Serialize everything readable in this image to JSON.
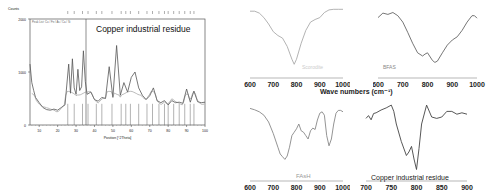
{
  "chart_data": [
    {
      "type": "line",
      "title": "Copper industrial residue",
      "xlabel": "Position [°2Theta]",
      "ylabel": "Counts",
      "xlim": [
        5,
        100
      ],
      "ylim": [
        0,
        2000
      ],
      "xticks": [
        10,
        20,
        30,
        40,
        50,
        60,
        70,
        80,
        90,
        100
      ],
      "yticks": [
        0,
        1000,
        2000
      ],
      "ytick_labels": [
        "0",
        "1000",
        "2000"
      ],
      "grid": false,
      "annotation": "XRD pattern with reference peak markers",
      "x": [
        5,
        6,
        7,
        8,
        10,
        12,
        14,
        16,
        18,
        20,
        22,
        24,
        26,
        27,
        28,
        29,
        30,
        31,
        32,
        33,
        34,
        35,
        36,
        38,
        40,
        42,
        44,
        46,
        48,
        50,
        52,
        54,
        56,
        58,
        60,
        62,
        64,
        66,
        68,
        70,
        72,
        74,
        76,
        78,
        80,
        82,
        84,
        86,
        88,
        90,
        92,
        94,
        96,
        98,
        100
      ],
      "values": [
        1150,
        800,
        650,
        520,
        420,
        330,
        290,
        280,
        300,
        280,
        330,
        380,
        1150,
        600,
        1250,
        700,
        580,
        1050,
        650,
        720,
        1400,
        820,
        580,
        620,
        480,
        450,
        520,
        500,
        1100,
        520,
        1500,
        560,
        800,
        620,
        900,
        1000,
        700,
        560,
        480,
        550,
        700,
        460,
        420,
        460,
        380,
        460,
        420,
        430,
        410,
        680,
        430,
        640,
        440,
        420,
        430
      ],
      "reference_peaks_2theta": [
        25.5,
        29,
        33.5,
        36.5,
        41,
        44,
        49.5,
        54.5,
        57,
        59.5,
        64,
        68.5,
        71.5,
        75,
        78,
        80,
        83,
        86,
        89,
        92,
        94
      ]
    },
    {
      "type": "line",
      "title": "Scorodite",
      "label": "Scorodite",
      "xlabel": "Wave numbers (cm⁻¹)",
      "xlim": [
        600,
        1000
      ],
      "xticks": [
        600,
        700,
        800,
        900,
        1000
      ],
      "x": [
        600,
        620,
        640,
        660,
        680,
        700,
        720,
        740,
        760,
        780,
        790,
        800,
        820,
        840,
        860,
        880,
        900,
        920,
        940,
        960,
        980,
        1000
      ],
      "values": [
        0.95,
        0.95,
        0.92,
        0.85,
        0.75,
        0.63,
        0.57,
        0.53,
        0.4,
        0.2,
        0.12,
        0.2,
        0.45,
        0.65,
        0.78,
        0.82,
        0.85,
        0.93,
        0.97,
        0.98,
        0.98,
        0.98
      ]
    },
    {
      "type": "line",
      "title": "BFAS",
      "label": "BFAS",
      "xlabel": "Wave numbers (cm⁻¹)",
      "xlim": [
        600,
        1000
      ],
      "xticks": [
        600,
        700,
        800,
        900,
        1000
      ],
      "x": [
        600,
        620,
        640,
        660,
        680,
        700,
        720,
        740,
        760,
        780,
        790,
        800,
        820,
        830,
        840,
        860,
        880,
        900,
        920,
        940,
        960,
        980,
        990,
        1000
      ],
      "values": [
        0.85,
        0.92,
        0.9,
        0.93,
        0.88,
        0.78,
        0.62,
        0.45,
        0.3,
        0.25,
        0.28,
        0.3,
        0.18,
        0.15,
        0.17,
        0.3,
        0.42,
        0.5,
        0.55,
        0.65,
        0.78,
        0.88,
        0.88,
        0.84
      ]
    },
    {
      "type": "line",
      "title": "FAsH",
      "label": "FAsH",
      "xlabel": "Wave numbers (cm⁻¹)",
      "xlim": [
        600,
        1000
      ],
      "xticks": [
        600,
        700,
        800,
        900,
        1000
      ],
      "x": [
        600,
        620,
        640,
        660,
        680,
        700,
        720,
        730,
        740,
        750,
        760,
        770,
        780,
        790,
        800,
        810,
        820,
        830,
        840,
        850,
        860,
        870,
        880,
        890,
        900,
        910,
        920,
        930,
        940,
        950,
        960,
        970,
        980,
        990,
        1000
      ],
      "values": [
        0.95,
        0.93,
        0.9,
        0.85,
        0.75,
        0.58,
        0.38,
        0.28,
        0.24,
        0.2,
        0.25,
        0.38,
        0.55,
        0.6,
        0.65,
        0.72,
        0.62,
        0.6,
        0.55,
        0.5,
        0.62,
        0.66,
        0.64,
        0.78,
        0.88,
        0.9,
        0.85,
        0.55,
        0.4,
        0.5,
        0.72,
        0.88,
        0.92,
        0.92,
        0.9
      ]
    },
    {
      "type": "line",
      "title": "Copper industrial residue",
      "label": "Copper industrial residue",
      "xlim": [
        700,
        900
      ],
      "xticks": [
        700,
        750,
        800,
        850,
        900
      ],
      "x": [
        700,
        705,
        710,
        715,
        720,
        730,
        740,
        750,
        755,
        760,
        770,
        780,
        785,
        790,
        795,
        800,
        805,
        810,
        820,
        830,
        840,
        850,
        860,
        870,
        880,
        890,
        900
      ],
      "values": [
        0.78,
        0.82,
        0.76,
        0.85,
        0.86,
        0.9,
        0.93,
        0.97,
        0.88,
        0.7,
        0.45,
        0.25,
        0.3,
        0.38,
        0.2,
        0.05,
        0.35,
        0.7,
        0.97,
        0.8,
        0.78,
        0.8,
        0.88,
        0.88,
        0.84,
        0.86,
        0.84
      ]
    }
  ],
  "panels": {
    "xrd": {
      "title": "Copper industrial residue",
      "y_axis_title": "Counts",
      "y_ticks": [
        "2000",
        "1000",
        "0"
      ],
      "x_ticks": [
        "10",
        "20",
        "30",
        "40",
        "50",
        "60",
        "70",
        "80",
        "90",
        "100"
      ],
      "x_axis_title": "Position [°2Theta]",
      "legend_text": "Peak List: Cu / Fe / As / Ca / Si"
    },
    "scorodite": {
      "label": "Scorodite",
      "x_ticks": [
        "600",
        "700",
        "800",
        "900",
        "1000"
      ]
    },
    "bfas": {
      "label": "BFAS",
      "x_ticks": [
        "600",
        "700",
        "800",
        "900",
        "1000"
      ]
    },
    "shared_xlabel": "Wave numbers (cm⁻¹)",
    "fash": {
      "label": "FAsH",
      "x_ticks": [
        "600",
        "700",
        "800",
        "900",
        "1000"
      ]
    },
    "residue_ir": {
      "label": "Copper industrial residue",
      "x_ticks": [
        "700",
        "750",
        "800",
        "850",
        "900"
      ]
    }
  }
}
